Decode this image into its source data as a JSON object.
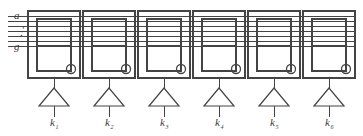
{
  "figure": {
    "type": "circuit-diagram",
    "background_color": "#ffffff",
    "line_color": "#444444",
    "text_color": "#3a3a3a"
  },
  "bus": {
    "top_label": "a",
    "bottom_label": "g",
    "ellipsis": "⋮",
    "line_count": 7,
    "segment_names": [
      "a",
      "b",
      "c",
      "d",
      "e",
      "f",
      "g"
    ]
  },
  "digits": [
    {
      "index": 1,
      "select_label": "k",
      "select_sub": "1",
      "decimal_point": true
    },
    {
      "index": 2,
      "select_label": "k",
      "select_sub": "2",
      "decimal_point": true
    },
    {
      "index": 3,
      "select_label": "k",
      "select_sub": "3",
      "decimal_point": true
    },
    {
      "index": 4,
      "select_label": "k",
      "select_sub": "4",
      "decimal_point": true
    },
    {
      "index": 5,
      "select_label": "k",
      "select_sub": "5",
      "decimal_point": true
    },
    {
      "index": 6,
      "select_label": "k",
      "select_sub": "6",
      "decimal_point": true
    }
  ],
  "geometry": {
    "module_x": [
      28,
      83,
      138,
      193,
      248,
      303
    ],
    "module_width": 52,
    "module_top": 11,
    "module_bottom": 78,
    "glyph_inset_x": 9,
    "glyph_top": 19,
    "glyph_bottom": 71,
    "glyph_width": 34,
    "middle_segment_y": 46,
    "dp_radius": 4.5,
    "bus_y": [
      16,
      21,
      26,
      31,
      36,
      41,
      46
    ],
    "bus_left": 8,
    "driver_apex_y": 88,
    "driver_base_y": 106,
    "driver_half_width": 15,
    "label_y": 126
  }
}
